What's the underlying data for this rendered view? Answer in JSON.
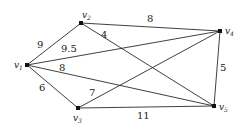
{
  "diagram": {
    "type": "weighted-undirected-graph",
    "nodes": [
      {
        "id": "v1",
        "label": "v",
        "sub": "1",
        "x": 27,
        "y": 65
      },
      {
        "id": "v2",
        "label": "v",
        "sub": "2",
        "x": 81,
        "y": 23
      },
      {
        "id": "v3",
        "label": "v",
        "sub": "3",
        "x": 78,
        "y": 108
      },
      {
        "id": "v4",
        "label": "v",
        "sub": "4",
        "x": 220,
        "y": 31
      },
      {
        "id": "v5",
        "label": "v",
        "sub": "5",
        "x": 214,
        "y": 106
      }
    ],
    "edges": [
      {
        "from": "v1",
        "to": "v2",
        "weight": "9"
      },
      {
        "from": "v1",
        "to": "v4",
        "weight": "9.5"
      },
      {
        "from": "v1",
        "to": "v5",
        "weight": "8"
      },
      {
        "from": "v1",
        "to": "v3",
        "weight": "6"
      },
      {
        "from": "v2",
        "to": "v4",
        "weight": "8"
      },
      {
        "from": "v2",
        "to": "v5",
        "weight": "4"
      },
      {
        "from": "v3",
        "to": "v4",
        "weight": "7"
      },
      {
        "from": "v3",
        "to": "v5",
        "weight": "11"
      },
      {
        "from": "v4",
        "to": "v5",
        "weight": "5"
      }
    ]
  }
}
